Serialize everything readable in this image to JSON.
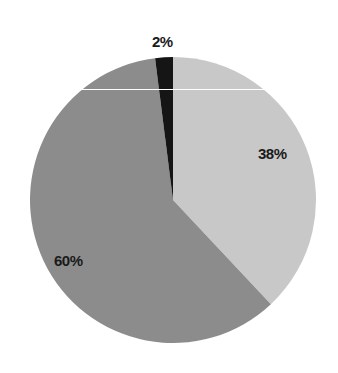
{
  "chart_data": {
    "type": "pie",
    "title": "",
    "start_angle_deg": 0,
    "direction": "clockwise",
    "slices": [
      {
        "label": "38%",
        "value": 38,
        "color": "#c8c8c8"
      },
      {
        "label": "60%",
        "value": 60,
        "color": "#8c8c8c"
      },
      {
        "label": "2%",
        "value": 2,
        "color": "#151515"
      }
    ],
    "legend": null
  },
  "labels": {
    "slice_a": "38%",
    "slice_b": "60%",
    "slice_c": "2%"
  }
}
